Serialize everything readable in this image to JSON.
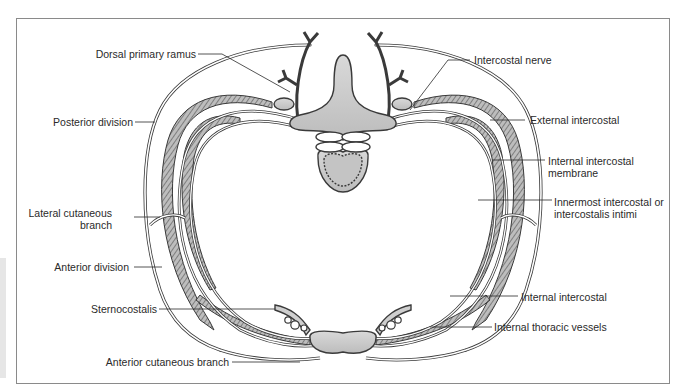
{
  "diagram": {
    "type": "anatomical cross-section",
    "colors": {
      "line": "#3a3a3a",
      "fill_gray": "#c8c8c8",
      "hatch": "#7a7a7a",
      "frame": "#8a8a8a"
    },
    "labels_left": [
      {
        "id": "dorsal-primary-ramus",
        "text": "Dorsal primary ramus"
      },
      {
        "id": "posterior-division",
        "text": "Posterior division"
      },
      {
        "id": "lateral-cutaneous-branch-1",
        "text": "Lateral cutaneous"
      },
      {
        "id": "lateral-cutaneous-branch-2",
        "text": "branch"
      },
      {
        "id": "anterior-division",
        "text": "Anterior division"
      },
      {
        "id": "sternocostalis",
        "text": "Sternocostalis"
      },
      {
        "id": "anterior-cutaneous-branch",
        "text": "Anterior cutaneous branch"
      }
    ],
    "labels_right": [
      {
        "id": "intercostal-nerve",
        "text": "Intercostal nerve"
      },
      {
        "id": "external-intercostal",
        "text": "External intercostal"
      },
      {
        "id": "internal-intercostal-membrane-1",
        "text": "Internal intercostal"
      },
      {
        "id": "internal-intercostal-membrane-2",
        "text": "membrane"
      },
      {
        "id": "innermost-intercostal-1",
        "text": "Innermost intercostal or"
      },
      {
        "id": "innermost-intercostal-2",
        "text": "intercostalis intimi"
      },
      {
        "id": "internal-intercostal",
        "text": "Internal intercostal"
      },
      {
        "id": "internal-thoracic-vessels",
        "text": "Internal thoracic vessels"
      }
    ]
  }
}
